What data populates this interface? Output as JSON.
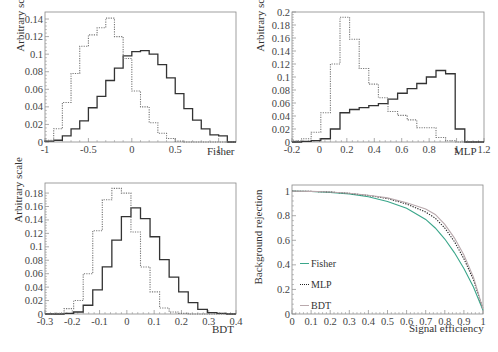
{
  "chart_data": [
    {
      "type": "bar",
      "subtype": "step-histogram",
      "title": "",
      "xlabel": "Fisher",
      "ylabel": "Arbitrary scale",
      "xlim": [
        -1,
        1.2
      ],
      "ylim": [
        0,
        0.148
      ],
      "xticks": [
        -1,
        -0.5,
        0,
        0.5,
        1
      ],
      "xtick_labels": [
        "-1",
        "-0.5",
        "0",
        "0.5",
        "1"
      ],
      "yticks": [
        0,
        0.02,
        0.04,
        0.06,
        0.08,
        0.1,
        0.12,
        0.14
      ],
      "ytick_labels": [
        "0",
        "0.02",
        "0.04",
        "0.06",
        "0.08",
        "0.1",
        "0.12",
        "0.14"
      ],
      "bin_edges_start": -1.0,
      "bin_width": 0.1,
      "series": [
        {
          "name": "signal",
          "style": "solid",
          "values": [
            0.001,
            0.002,
            0.007,
            0.015,
            0.024,
            0.039,
            0.052,
            0.07,
            0.084,
            0.098,
            0.103,
            0.104,
            0.1,
            0.088,
            0.073,
            0.055,
            0.038,
            0.025,
            0.015,
            0.008,
            0.007,
            0.0
          ]
        },
        {
          "name": "background",
          "style": "dotted",
          "values": [
            0.002,
            0.015,
            0.045,
            0.078,
            0.109,
            0.122,
            0.13,
            0.141,
            0.12,
            0.095,
            0.058,
            0.04,
            0.022,
            0.01,
            0.004,
            0.001,
            0.0,
            0.0,
            0.0,
            0.0,
            0.0,
            0.0
          ]
        }
      ],
      "grid": false
    },
    {
      "type": "bar",
      "subtype": "step-histogram",
      "title": "",
      "xlabel": "MLP",
      "ylabel": "Arbitrary scale",
      "xlim": [
        -0.2,
        1.2
      ],
      "ylim": [
        0,
        0.2
      ],
      "xticks": [
        -0.2,
        0,
        0.2,
        0.4,
        0.6,
        0.8,
        1,
        1.2
      ],
      "xtick_labels": [
        "-0.2",
        "0",
        "0.2",
        "0.4",
        "0.6",
        "0.8",
        "1",
        "1.2"
      ],
      "yticks": [
        0,
        0.02,
        0.04,
        0.06,
        0.08,
        0.1,
        0.12,
        0.14,
        0.16,
        0.18,
        0.2
      ],
      "ytick_labels": [
        "0",
        "0.02",
        "0.04",
        "0.06",
        "0.08",
        "0.1",
        "0.12",
        "0.14",
        "0.16",
        "0.18",
        "0.2"
      ],
      "bin_edges_start": -0.2,
      "bin_width": 0.07,
      "series": [
        {
          "name": "signal",
          "style": "solid",
          "values": [
            0.0,
            0.001,
            0.002,
            0.005,
            0.02,
            0.045,
            0.05,
            0.053,
            0.056,
            0.059,
            0.066,
            0.075,
            0.082,
            0.09,
            0.1,
            0.11,
            0.105,
            0.02,
            0.0,
            0.0
          ]
        },
        {
          "name": "background",
          "style": "dotted",
          "values": [
            0.002,
            0.005,
            0.015,
            0.045,
            0.12,
            0.192,
            0.158,
            0.113,
            0.089,
            0.068,
            0.047,
            0.041,
            0.034,
            0.022,
            0.022,
            0.007,
            0.002,
            0.0,
            0.0,
            0.0
          ]
        }
      ],
      "grid": false
    },
    {
      "type": "bar",
      "subtype": "step-histogram",
      "title": "",
      "xlabel": "BDT",
      "ylabel": "Arbitrary scale",
      "xlim": [
        -0.3,
        0.4
      ],
      "ylim": [
        0,
        0.195
      ],
      "xticks": [
        -0.3,
        -0.2,
        -0.1,
        0,
        0.1,
        0.2,
        0.3,
        0.4
      ],
      "xtick_labels": [
        "-0.3",
        "-0.2",
        "-0.1",
        "0",
        "0.1",
        "0.2",
        "0.3",
        "0.4"
      ],
      "yticks": [
        0,
        0.02,
        0.04,
        0.06,
        0.08,
        0.1,
        0.12,
        0.14,
        0.16,
        0.18
      ],
      "ytick_labels": [
        "0",
        "0.02",
        "0.04",
        "0.06",
        "0.08",
        "0.1",
        "0.12",
        "0.14",
        "0.16",
        "0.18"
      ],
      "bin_edges_start": -0.3,
      "bin_width": 0.035,
      "series": [
        {
          "name": "signal",
          "style": "solid",
          "values": [
            0.0,
            0.0,
            0.001,
            0.003,
            0.013,
            0.036,
            0.07,
            0.11,
            0.145,
            0.158,
            0.142,
            0.115,
            0.081,
            0.055,
            0.033,
            0.017,
            0.007,
            0.002,
            0.001,
            0.0
          ]
        },
        {
          "name": "background",
          "style": "dotted",
          "values": [
            0.0,
            0.001,
            0.008,
            0.02,
            0.06,
            0.124,
            0.17,
            0.187,
            0.18,
            0.122,
            0.07,
            0.033,
            0.009,
            0.003,
            0.001,
            0.0,
            0.0,
            0.0,
            0.0,
            0.0
          ]
        }
      ],
      "grid": false
    },
    {
      "type": "line",
      "title": "",
      "xlabel": "Signal efficiency",
      "ylabel": "Background rejection",
      "xlim": [
        0,
        1
      ],
      "ylim": [
        0,
        1.05
      ],
      "xticks": [
        0,
        0.1,
        0.2,
        0.3,
        0.4,
        0.5,
        0.6,
        0.7,
        0.8,
        0.9,
        1
      ],
      "xtick_labels": [
        "0",
        "0.1",
        "0.2",
        "0.3",
        "0.4",
        "0.5",
        "0.6",
        "0.7",
        "0.8",
        "0.9",
        "1"
      ],
      "yticks": [
        0,
        0.2,
        0.4,
        0.6,
        0.8,
        1
      ],
      "ytick_labels": [
        "0",
        "0.2",
        "0.4",
        "0.6",
        "0.8",
        "1"
      ],
      "x": [
        0,
        0.1,
        0.2,
        0.3,
        0.4,
        0.5,
        0.6,
        0.7,
        0.75,
        0.8,
        0.85,
        0.9,
        0.95,
        1.0
      ],
      "series": [
        {
          "name": "Fisher",
          "style": "solid",
          "color": "#3aa68a",
          "values": [
            1.0,
            0.997,
            0.99,
            0.978,
            0.955,
            0.915,
            0.86,
            0.77,
            0.7,
            0.61,
            0.5,
            0.37,
            0.22,
            0.03
          ]
        },
        {
          "name": "MLP",
          "style": "dotted",
          "color": "#222222",
          "values": [
            1.0,
            0.998,
            0.993,
            0.982,
            0.965,
            0.94,
            0.895,
            0.83,
            0.78,
            0.7,
            0.59,
            0.45,
            0.28,
            0.04
          ]
        },
        {
          "name": "BDT",
          "style": "solid",
          "color": "#b9a9ad",
          "values": [
            1.0,
            0.998,
            0.993,
            0.983,
            0.966,
            0.945,
            0.905,
            0.855,
            0.81,
            0.73,
            0.62,
            0.48,
            0.3,
            0.04
          ]
        }
      ],
      "legend": {
        "position": "center-left",
        "entries": [
          "Fisher",
          "MLP",
          "BDT"
        ]
      },
      "grid": false
    }
  ],
  "panels": [
    {
      "xlabel": "Fisher",
      "ylabel": "Arbitrary scale"
    },
    {
      "xlabel": "MLP",
      "ylabel": "Arbitrary scale"
    },
    {
      "xlabel": "BDT",
      "ylabel": "Arbitrary scale"
    },
    {
      "xlabel": "Signal efficiency",
      "ylabel": "Background rejection",
      "legend": [
        {
          "label": "Fisher",
          "color": "#3aa68a",
          "dash": ""
        },
        {
          "label": "MLP",
          "color": "#222222",
          "dash": "1.5,1.5"
        },
        {
          "label": "BDT",
          "color": "#b9a9ad",
          "dash": ""
        }
      ]
    }
  ],
  "colors": {
    "frame": "#888888",
    "signal": "#333333",
    "background": "#777777",
    "text": "#444444"
  }
}
